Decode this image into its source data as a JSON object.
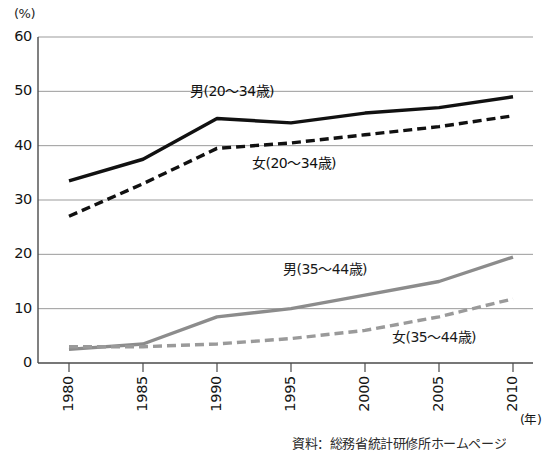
{
  "chart_data": {
    "type": "line",
    "title": "",
    "unit_label": "(%)",
    "xlabel": "(年)",
    "ylabel": "",
    "x": [
      1980,
      1985,
      1990,
      1995,
      2000,
      2005,
      2010
    ],
    "xticklabels": [
      "1980",
      "1985",
      "1990",
      "1995",
      "2000",
      "2005",
      "2010"
    ],
    "yticklabels": [
      "60",
      "50",
      "40",
      "30",
      "20",
      "10",
      "0"
    ],
    "yticks": [
      60,
      50,
      40,
      30,
      20,
      10,
      0
    ],
    "ylim": [
      0,
      60
    ],
    "grid": true,
    "legend_position": "inline-annotations",
    "series": [
      {
        "name": "男(20〜34歳)",
        "style": "solid",
        "color": "#111111",
        "width": 3.4,
        "values": [
          33.5,
          37.5,
          45.0,
          44.2,
          46.0,
          47.0,
          49.0
        ]
      },
      {
        "name": "女(20〜34歳)",
        "style": "dashed",
        "color": "#111111",
        "width": 3.4,
        "values": [
          27.0,
          33.0,
          39.5,
          40.5,
          42.0,
          43.5,
          45.5
        ]
      },
      {
        "name": "男(35〜44歳)",
        "style": "solid",
        "color": "#8c8c8c",
        "width": 3.4,
        "values": [
          2.5,
          3.5,
          8.5,
          10.0,
          12.5,
          15.0,
          19.5
        ]
      },
      {
        "name": "女(35〜44歳)",
        "style": "dashed",
        "color": "#9a9a9a",
        "width": 3.4,
        "values": [
          3.0,
          3.0,
          3.5,
          4.5,
          6.0,
          8.5,
          11.8
        ]
      }
    ],
    "annotations": [
      {
        "text": "男(20〜34歳)",
        "x": 190,
        "y": 84
      },
      {
        "text": "女(20〜34歳)",
        "x": 252,
        "y": 156
      },
      {
        "text": "男(35〜44歳)",
        "x": 283,
        "y": 262
      },
      {
        "text": "女(35〜44歳)",
        "x": 392,
        "y": 330
      }
    ]
  },
  "source": {
    "note": "資料：総務省統計研修所ホームページ"
  }
}
